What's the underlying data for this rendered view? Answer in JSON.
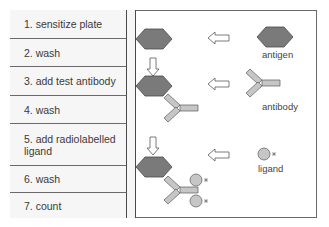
{
  "steps": [
    {
      "label": "1.  sensitize plate"
    },
    {
      "label": "2.  wash"
    },
    {
      "label": "3.  add test antibody"
    },
    {
      "label": "4.  wash"
    },
    {
      "label": "5.  add radiolabelled ligand"
    },
    {
      "label": "6.  wash"
    },
    {
      "label": "7.  count"
    }
  ],
  "legend": {
    "antigen": "antigen",
    "antibody": "antibody",
    "ligand": "ligand"
  },
  "colors": {
    "antigen": "#7a7a7a",
    "antibody": "#c6c6c6",
    "ligand": "#c6c6c6",
    "border": "#6a6a6a"
  }
}
